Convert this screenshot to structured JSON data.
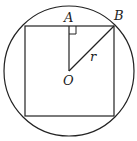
{
  "diagram": {
    "labels": {
      "A": "A",
      "B": "B",
      "O": "O",
      "r": "r"
    },
    "stroke_color": "#222222",
    "background": "#ffffff",
    "circle": {
      "cx": 69,
      "cy": 71,
      "r": 65
    },
    "square": {
      "x": 25,
      "y": 26,
      "size": 89
    },
    "segments": [
      {
        "name": "OA",
        "from": "O",
        "to": "A"
      },
      {
        "name": "OB",
        "from": "O",
        "to": "B",
        "label": "r"
      }
    ],
    "right_angle_at": "A"
  }
}
